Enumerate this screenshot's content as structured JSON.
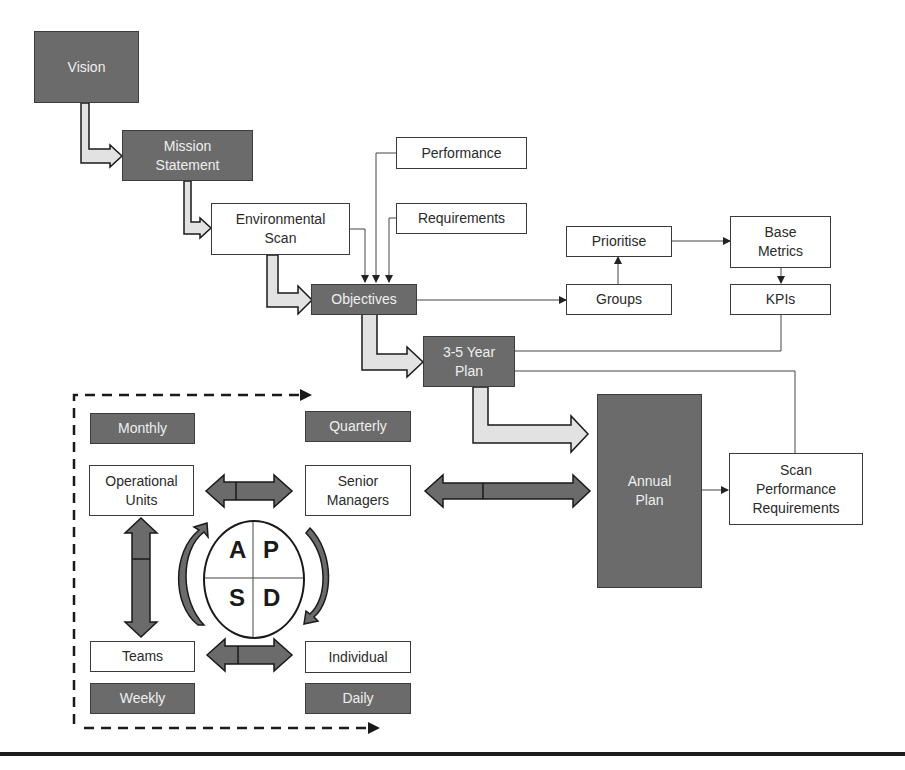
{
  "diagram": {
    "colors": {
      "dark_fill": "#6b6b6b",
      "light_arrow_fill": "#e0e0e0",
      "line": "#3a3a3a",
      "text_dark_box": "#efefef"
    },
    "nodes": {
      "vision": "Vision",
      "mission": "Mission\nStatement",
      "env_scan": "Environmental\nScan",
      "performance": "Performance",
      "requirements": "Requirements",
      "objectives": "Objectives",
      "prioritise": "Prioritise",
      "groups": "Groups",
      "base_metrics": "Base\nMetrics",
      "kpis": "KPIs",
      "three_five_year_plan": "3-5 Year\nPlan",
      "annual_plan": "Annual\nPlan",
      "scan_perf_req": "Scan\nPerformance\nRequirements",
      "monthly": "Monthly",
      "quarterly": "Quarterly",
      "operational_units": "Operational\nUnits",
      "senior_managers": "Senior\nManagers",
      "teams": "Teams",
      "individual": "Individual",
      "weekly": "Weekly",
      "daily": "Daily"
    },
    "pdca": {
      "a": "A",
      "p": "P",
      "s": "S",
      "d": "D"
    },
    "edges": [
      {
        "from": "Vision",
        "to": "Mission Statement",
        "style": "block-arrow"
      },
      {
        "from": "Mission Statement",
        "to": "Environmental Scan",
        "style": "block-arrow"
      },
      {
        "from": "Environmental Scan",
        "to": "Objectives",
        "style": "block-arrow"
      },
      {
        "from": "Environmental Scan",
        "to": "Objectives",
        "style": "line"
      },
      {
        "from": "Performance",
        "to": "Objectives",
        "style": "line"
      },
      {
        "from": "Requirements",
        "to": "Objectives",
        "style": "line"
      },
      {
        "from": "Objectives",
        "to": "Groups",
        "style": "line"
      },
      {
        "from": "Groups",
        "to": "Prioritise",
        "style": "line"
      },
      {
        "from": "Prioritise",
        "to": "Base Metrics",
        "style": "line"
      },
      {
        "from": "Base Metrics",
        "to": "KPIs",
        "style": "line"
      },
      {
        "from": "KPIs",
        "to": "3-5 Year Plan",
        "style": "line"
      },
      {
        "from": "Objectives",
        "to": "3-5 Year Plan",
        "style": "block-arrow"
      },
      {
        "from": "3-5 Year Plan",
        "to": "Annual Plan",
        "style": "block-arrow"
      },
      {
        "from": "Annual Plan",
        "to": "Scan Performance Requirements",
        "style": "line"
      },
      {
        "from": "Scan Performance Requirements",
        "to": "3-5 Year Plan",
        "style": "line"
      },
      {
        "from": "Annual Plan",
        "to": "Senior Managers",
        "style": "double-arrow"
      },
      {
        "from": "Senior Managers",
        "to": "Operational Units",
        "style": "double-arrow"
      },
      {
        "from": "Operational Units",
        "to": "Teams",
        "style": "double-arrow"
      },
      {
        "from": "Teams",
        "to": "Individual",
        "style": "double-arrow"
      }
    ]
  }
}
